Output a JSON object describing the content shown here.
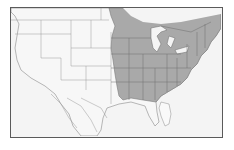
{
  "map": {
    "type": "range-map",
    "region": "North America (United States, southern Canada, northern Mexico)",
    "highlighted_region": "Eastern United States and southeastern Canada",
    "colors": {
      "background": "#f4f4f4",
      "land": "#f7f7f7",
      "range_fill": "#a9a9a9",
      "borders": "#8a8a8a",
      "frame": "#5a5a5a",
      "water": "#f4f4f4"
    }
  }
}
